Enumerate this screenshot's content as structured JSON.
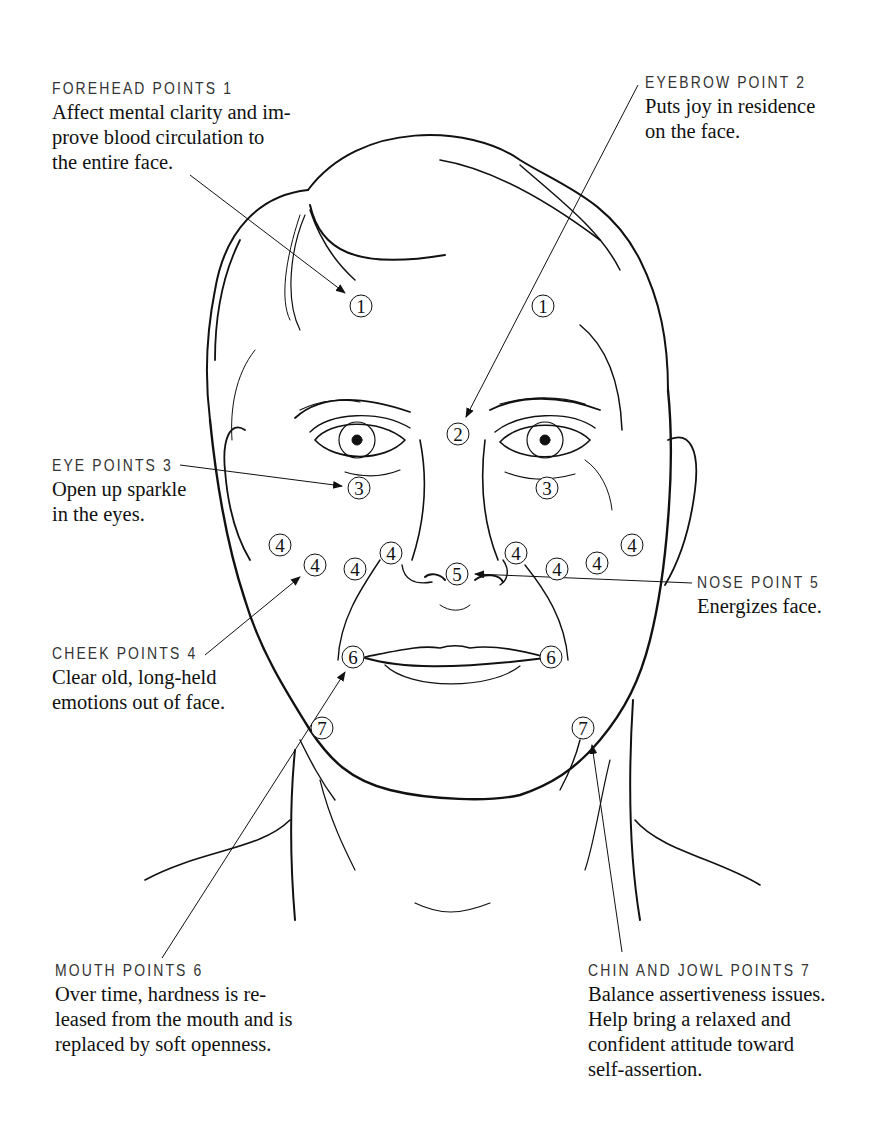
{
  "diagram": {
    "labels": [
      {
        "id": "forehead",
        "heading": "FOREHEAD POINTS 1",
        "text": "Affect mental clarity and im-\nprove blood circulation to\nthe entire face."
      },
      {
        "id": "eyebrow",
        "heading": "EYEBROW POINT 2",
        "text": "Puts joy in residence\non the face."
      },
      {
        "id": "eye",
        "heading": "EYE POINTS 3",
        "text": "Open up sparkle\nin the eyes."
      },
      {
        "id": "cheek",
        "heading": "CHEEK POINTS 4",
        "text": "Clear old, long-held\nemotions out of face."
      },
      {
        "id": "nose",
        "heading": "NOSE POINT 5",
        "text": "Energizes face."
      },
      {
        "id": "mouth",
        "heading": "MOUTH POINTS 6",
        "text": "Over time, hardness is re-\nleased from the mouth and is\nreplaced by soft openness."
      },
      {
        "id": "chin",
        "heading": "CHIN AND JOWL POINTS 7",
        "text": "Balance assertiveness issues.\nHelp bring a relaxed and\nconfident attitude toward\nself-assertion."
      }
    ],
    "points": [
      {
        "n": "1",
        "x": 361,
        "y": 306
      },
      {
        "n": "1",
        "x": 543,
        "y": 306
      },
      {
        "n": "2",
        "x": 458,
        "y": 434
      },
      {
        "n": "3",
        "x": 359,
        "y": 488
      },
      {
        "n": "3",
        "x": 547,
        "y": 488
      },
      {
        "n": "4",
        "x": 280,
        "y": 545
      },
      {
        "n": "4",
        "x": 315,
        "y": 565
      },
      {
        "n": "4",
        "x": 355,
        "y": 569
      },
      {
        "n": "4",
        "x": 391,
        "y": 553
      },
      {
        "n": "4",
        "x": 516,
        "y": 553
      },
      {
        "n": "4",
        "x": 557,
        "y": 569
      },
      {
        "n": "4",
        "x": 597,
        "y": 563
      },
      {
        "n": "4",
        "x": 632,
        "y": 545
      },
      {
        "n": "5",
        "x": 457,
        "y": 574
      },
      {
        "n": "6",
        "x": 353,
        "y": 657
      },
      {
        "n": "6",
        "x": 551,
        "y": 657
      },
      {
        "n": "7",
        "x": 322,
        "y": 728
      },
      {
        "n": "7",
        "x": 583,
        "y": 728
      }
    ],
    "colors": {
      "ink": "#111111",
      "heading": "#333333",
      "background": "#ffffff"
    }
  }
}
